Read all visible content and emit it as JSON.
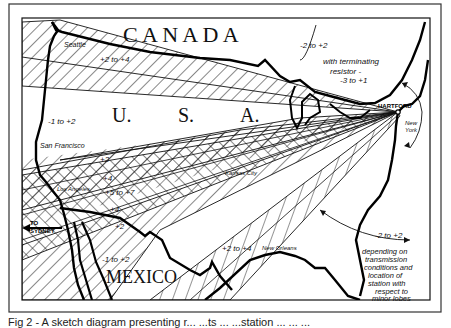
{
  "figure": {
    "caption": "Fig 2 - A sketch diagram presenting r... ...ts ... ...station ... ... ...",
    "origin_station": "HARTFORD"
  },
  "countries": {
    "canada": "C A N A D A",
    "usa_u": "U.",
    "usa_s": "S.",
    "usa_a": "A.",
    "mexico": "MEXICO"
  },
  "cities": {
    "seattle": "Seattle",
    "san_francisco": "San Francisco",
    "los_angeles": "Los Angeles",
    "kansas_city": "Kansas City",
    "new_orleans": "New Orleans",
    "hartford": "HARTFORD",
    "new_york_1": "New",
    "new_york_2": "York"
  },
  "annotations": {
    "north_band": "+2 to +4",
    "north_gap": "-1 to +2",
    "main_plus2_top": "+2",
    "main_plus4_a": "+4",
    "main_plus5to7": "+5 to +7",
    "main_plus4_b": "+4",
    "main_plus2_bottom": "+2",
    "mexico_gap": "-1 to +2",
    "south_band": "+2 to +4",
    "to_sydney_1": "TO",
    "to_sydney_2": "SYDNEY",
    "north_arc": "-2 to +2",
    "terminating_1": "with terminating",
    "terminating_2": "resistor -",
    "terminating_3": "-3 to +1",
    "south_arc": "-2 to +2",
    "depending_1": "depending on",
    "depending_2": "transmission",
    "depending_3": "conditions and",
    "depending_4": "location of",
    "depending_5": "station with",
    "depending_6": "respect to",
    "depending_7": "minor lobes"
  },
  "colors": {
    "ink": "#111111",
    "paper": "#ffffff",
    "frame": "#333333"
  }
}
